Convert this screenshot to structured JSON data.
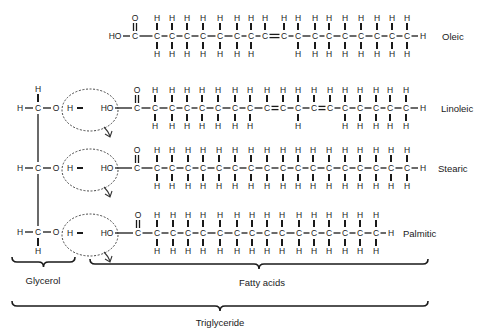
{
  "glycerol": {
    "atoms": {
      "H": "H",
      "C": "C",
      "O": "O"
    },
    "rows_y": [
      108,
      168,
      232
    ],
    "top_h_y": 89,
    "bottom_h_y": 251
  },
  "water_removal": {
    "h_label": "H",
    "ho_label": "HO",
    "bond": "–"
  },
  "fatty_acids": [
    {
      "name": "Oleic",
      "row_y": 36,
      "has_glycerol": false,
      "head": "HO",
      "head_x": 115,
      "carbonyl_x": 135,
      "carbons_x": [
        157,
        172,
        187,
        203,
        220,
        237,
        251,
        265,
        284,
        298,
        315,
        329,
        345,
        361,
        377,
        392,
        407
      ],
      "double_bonds_after_index": [
        7
      ],
      "no_h_below_index": [
        7,
        8
      ],
      "terminal_h_x": 423,
      "label_x": 442
    },
    {
      "name": "Linoleic",
      "row_y": 108,
      "has_glycerol": true,
      "head": "HO",
      "head_x": 107,
      "carbonyl_x": 137,
      "carbons_x": [
        155,
        172,
        187,
        202,
        218,
        235,
        250,
        267,
        283,
        298,
        314,
        330,
        345,
        360,
        376,
        390,
        406
      ],
      "double_bonds_after_index": [
        7,
        10
      ],
      "no_h_below_index": [
        7,
        8,
        10,
        11
      ],
      "terminal_h_x": 423,
      "label_x": 441
    },
    {
      "name": "Stearic",
      "row_y": 168,
      "has_glycerol": true,
      "head": "HO",
      "head_x": 107,
      "carbonyl_x": 137,
      "carbons_x": [
        157,
        172,
        188,
        203,
        219,
        235,
        251,
        267,
        283,
        298,
        313,
        329,
        345,
        360,
        376,
        391,
        407
      ],
      "double_bonds_after_index": [],
      "no_h_below_index": [],
      "terminal_h_x": 423,
      "label_x": 438
    },
    {
      "name": "Palmitic",
      "row_y": 233,
      "has_glycerol": true,
      "head": "HO",
      "head_x": 107,
      "carbonyl_x": 138,
      "carbons_x": [
        157,
        173,
        188,
        203,
        220,
        237,
        252,
        267,
        282,
        299,
        314,
        329,
        345,
        360,
        376
      ],
      "double_bonds_after_index": [],
      "no_h_below_index": [],
      "terminal_h_x": 391,
      "label_x": 403
    }
  ],
  "braces": [
    {
      "id": "glycerol",
      "label": "Glycerol",
      "x1": 12,
      "x2": 75,
      "y": 262,
      "label_x": 43,
      "label_y": 280
    },
    {
      "id": "fatty-acids",
      "label": "Fatty acids",
      "x1": 90,
      "x2": 428,
      "y": 264,
      "label_x": 262,
      "label_y": 282
    },
    {
      "id": "triglyceride",
      "label": "Triglyceride",
      "x1": 12,
      "x2": 428,
      "y": 306,
      "label_x": 220,
      "label_y": 322
    }
  ],
  "colors": {
    "ink": "#1a1a1a",
    "background": "#ffffff"
  }
}
